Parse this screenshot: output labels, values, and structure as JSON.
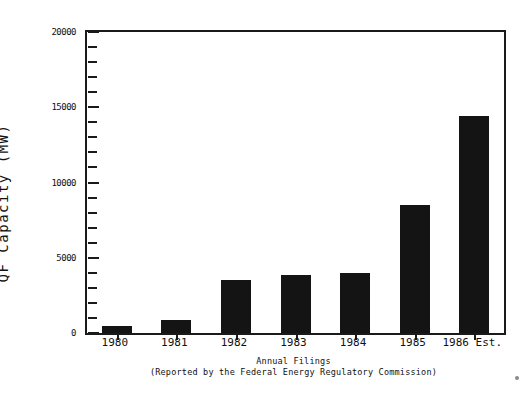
{
  "chart_data": {
    "type": "bar",
    "title": "",
    "subtitle": "",
    "xlabel": "Annual Filings",
    "xlabel_sub": "(Reported by the Federal Energy Regulatory Commission)",
    "ylabel": "QF Capacity (MW)",
    "categories": [
      "1980",
      "1981",
      "1982",
      "1983",
      "1984",
      "1985",
      "1986 Est."
    ],
    "values": [
      470,
      865,
      3520,
      3850,
      3990,
      8500,
      14400
    ],
    "ylim": [
      0,
      20000
    ],
    "yticks": [
      0,
      5000,
      10000,
      15000,
      20000
    ],
    "ytick_labels": [
      "0",
      "5000",
      "10000",
      "15000",
      "20000"
    ],
    "yminor_step": 1000,
    "grid": false,
    "legend": "none",
    "bar_color": "#141414",
    "axis_color": "#1a1a1a",
    "background": "#ffffff"
  },
  "figure": {
    "y_axis_title": "QF Capacity (MW)",
    "caption_line1": "Annual Filings",
    "caption_line2": "(Reported by the Federal Energy Regulatory Commission)"
  }
}
